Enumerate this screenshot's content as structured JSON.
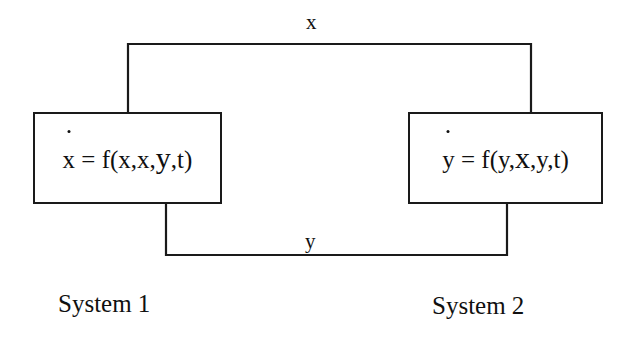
{
  "diagram": {
    "background_color": "#ffffff",
    "line_color": "#1a1a1a",
    "text_color": "#101010",
    "blocks": [
      {
        "id": "system1",
        "caption": "System 1",
        "equation_parts": {
          "state": "x",
          "lead": " = f(x,x,",
          "coupling_var": "y",
          "tail": ",t)"
        }
      },
      {
        "id": "system2",
        "caption": "System 2",
        "equation_parts": {
          "state": "y",
          "lead": " = f(y,",
          "coupling_var": "x",
          "tail": ",y,t)"
        }
      }
    ],
    "connections": [
      {
        "id": "feedforward",
        "label": "x",
        "from": "system1",
        "to": "system2",
        "route": "top",
        "arrowhead": "down"
      },
      {
        "id": "feedback",
        "label": "y",
        "from": "system2",
        "to": "system1",
        "route": "bottom",
        "arrowhead": "up"
      }
    ]
  }
}
